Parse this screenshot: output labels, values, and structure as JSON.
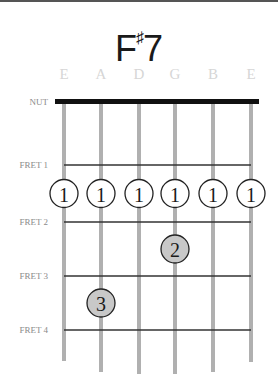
{
  "chord": {
    "root": "F",
    "accidental": "♯",
    "quality": "7"
  },
  "strings": [
    "E",
    "A",
    "D",
    "G",
    "B",
    "E"
  ],
  "nut_label": "NUT",
  "frets": [
    {
      "label": "FRET 1"
    },
    {
      "label": "FRET 2"
    },
    {
      "label": "FRET 3"
    },
    {
      "label": "FRET 4"
    }
  ],
  "fingerings": [
    {
      "string": 1,
      "fret": 1,
      "finger": "1",
      "style": "open"
    },
    {
      "string": 2,
      "fret": 1,
      "finger": "1",
      "style": "open"
    },
    {
      "string": 3,
      "fret": 1,
      "finger": "1",
      "style": "open"
    },
    {
      "string": 4,
      "fret": 1,
      "finger": "1",
      "style": "open"
    },
    {
      "string": 5,
      "fret": 1,
      "finger": "1",
      "style": "open"
    },
    {
      "string": 6,
      "fret": 1,
      "finger": "1",
      "style": "open"
    },
    {
      "string": 4,
      "fret": 2,
      "finger": "2",
      "style": "filled"
    },
    {
      "string": 2,
      "fret": 3,
      "finger": "3",
      "style": "filled"
    }
  ],
  "colors": {
    "string": "#b0b0b0",
    "fret": "#333333",
    "nut": "#111111",
    "open_fill": "#ffffff",
    "filled_fill": "#c8c8c8",
    "circle_stroke": "#222222"
  }
}
